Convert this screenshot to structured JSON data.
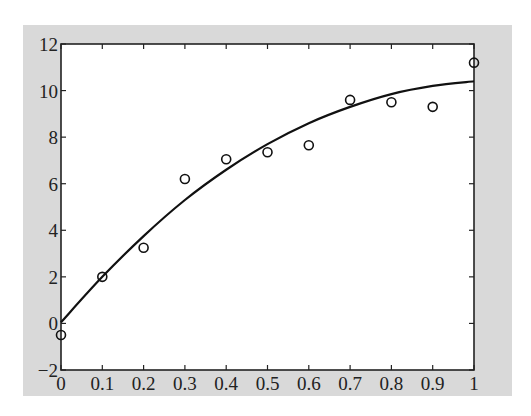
{
  "chart_data": {
    "type": "scatter",
    "title": "",
    "xlabel": "",
    "ylabel": "",
    "xlim": [
      0,
      1
    ],
    "ylim": [
      -2,
      12
    ],
    "xticks": [
      "0",
      "0.1",
      "0.2",
      "0.3",
      "0.4",
      "0.5",
      "0.6",
      "0.7",
      "0.8",
      "0.9",
      "1"
    ],
    "yticks": [
      "−2",
      "0",
      "2",
      "4",
      "6",
      "8",
      "10",
      "12"
    ],
    "grid": false,
    "legend": null,
    "series": [
      {
        "name": "data points",
        "style": "open-circle",
        "x": [
          0,
          0.1,
          0.2,
          0.3,
          0.4,
          0.5,
          0.6,
          0.7,
          0.8,
          0.9,
          1.0
        ],
        "y": [
          -0.5,
          2.0,
          3.25,
          6.2,
          7.05,
          7.35,
          7.65,
          9.6,
          9.5,
          9.3,
          11.2
        ]
      },
      {
        "name": "fitted curve",
        "style": "line",
        "x": [
          0,
          0.1,
          0.2,
          0.3,
          0.4,
          0.5,
          0.6,
          0.7,
          0.8,
          0.9,
          1.0
        ],
        "y": [
          0.05,
          2.0,
          3.75,
          5.3,
          6.6,
          7.7,
          8.6,
          9.3,
          9.85,
          10.2,
          10.4
        ]
      }
    ]
  }
}
